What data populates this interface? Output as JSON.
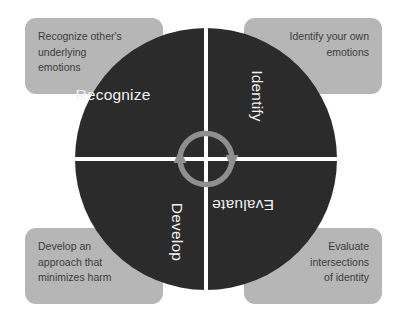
{
  "diagram": {
    "colors": {
      "background": "#ffffff",
      "wheel": "#2b2b2b",
      "callout_box": "#b6b6b6",
      "callout_text": "#3b3b3b",
      "wheel_label_text": "#f2f2f2",
      "divider": "#ffffff",
      "arrow": "#8f8f8f"
    },
    "wheel": {
      "quadrants": [
        {
          "id": "recognize",
          "label": "Recognize",
          "position": "top-left",
          "text_orientation": "horizontal"
        },
        {
          "id": "identify",
          "label": "Identify",
          "position": "top-right",
          "text_orientation": "rotated-90-clockwise"
        },
        {
          "id": "evaluate",
          "label": "Evaluate",
          "position": "bottom-right",
          "text_orientation": "rotated-180"
        },
        {
          "id": "develop",
          "label": "Develop",
          "position": "bottom-left",
          "text_orientation": "rotated-90-clockwise"
        }
      ],
      "center_icon": "cycle-arrows-icon"
    },
    "callouts": [
      {
        "id": "recognize-callout",
        "position": "top-left",
        "align": "left",
        "lines": [
          "Recognize other's",
          "underlying",
          "emotions"
        ],
        "text": "Recognize other's underlying emotions"
      },
      {
        "id": "identify-callout",
        "position": "top-right",
        "align": "right",
        "lines": [
          "Identify your own",
          "emotions"
        ],
        "text": "Identify your own emotions"
      },
      {
        "id": "develop-callout",
        "position": "bottom-left",
        "align": "left",
        "lines": [
          "Develop an",
          "approach that",
          "minimizes harm"
        ],
        "text": "Develop an approach that minimizes harm"
      },
      {
        "id": "evaluate-callout",
        "position": "bottom-right",
        "align": "right",
        "lines": [
          "Evaluate",
          "intersections",
          "of identity"
        ],
        "text": "Evaluate intersections of identity"
      }
    ]
  }
}
